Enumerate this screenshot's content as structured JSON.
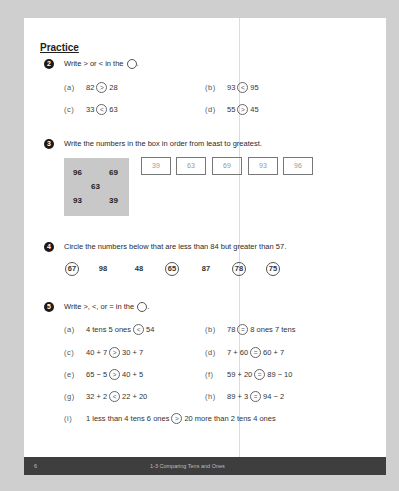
{
  "section_title": "Practice",
  "q2": {
    "number": "2",
    "instruction": "Write > or < in the",
    "items": [
      {
        "label": "(a)",
        "left": "82",
        "symbol": ">",
        "right": "28"
      },
      {
        "label": "(b)",
        "left": "93",
        "symbol": "<",
        "right": "95"
      },
      {
        "label": "(c)",
        "left": "33",
        "symbol": "<",
        "right": "63"
      },
      {
        "label": "(d)",
        "left": "55",
        "symbol": ">",
        "right": "45"
      }
    ]
  },
  "q3": {
    "number": "3",
    "instruction": "Write the numbers in the box in order from least to greatest.",
    "box_numbers": [
      "96",
      "69",
      "63",
      "93",
      "39"
    ],
    "answers": [
      "39",
      "63",
      "69",
      "93",
      "96"
    ]
  },
  "q4": {
    "number": "4",
    "instruction": "Circle the numbers below that are less than 84 but greater than 57.",
    "numbers": [
      {
        "value": "67",
        "circled": true
      },
      {
        "value": "98",
        "circled": false
      },
      {
        "value": "48",
        "circled": false
      },
      {
        "value": "65",
        "circled": true
      },
      {
        "value": "87",
        "circled": false
      },
      {
        "value": "78",
        "circled": true
      },
      {
        "value": "75",
        "circled": true
      }
    ]
  },
  "q5": {
    "number": "5",
    "instruction": "Write >, <, or = in the",
    "items": [
      {
        "label": "(a)",
        "left": "4 tens 5 ones",
        "symbol": "<",
        "right": "54"
      },
      {
        "label": "(b)",
        "left": "78",
        "symbol": "=",
        "right": "8 ones 7 tens"
      },
      {
        "label": "(c)",
        "left": "40 + 7",
        "symbol": ">",
        "right": "30 + 7"
      },
      {
        "label": "(d)",
        "left": "7 + 60",
        "symbol": "=",
        "right": "60 + 7"
      },
      {
        "label": "(e)",
        "left": "65 − 5",
        "symbol": ">",
        "right": "40 + 5"
      },
      {
        "label": "(f)",
        "left": "59 + 20",
        "symbol": "=",
        "right": "89 − 10"
      },
      {
        "label": "(g)",
        "left": "32 + 2",
        "symbol": "<",
        "right": "22 + 20"
      },
      {
        "label": "(h)",
        "left": "89 + 3",
        "symbol": "=",
        "right": "94 − 2"
      },
      {
        "label": "(i)",
        "left": "1 less than 4 tens 6 ones",
        "symbol": ">",
        "right": "20 more than 2 tens 4 ones"
      }
    ]
  },
  "footer": {
    "page_number": "6",
    "chapter_title": "1-3 Comparing Tens and Ones"
  }
}
